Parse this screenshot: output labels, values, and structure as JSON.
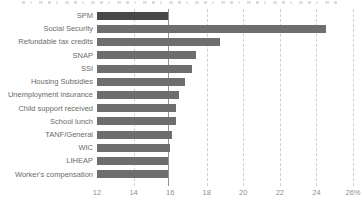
{
  "chart_data": {
    "type": "bar",
    "orientation": "horizontal",
    "title": "",
    "categories": [
      "SPM",
      "Social Security",
      "Refundable tax credits",
      "SNAP",
      "SSI",
      "Housing Subsidies",
      "Unemployment insurance",
      "Child support received",
      "School lunch",
      "TANF/General",
      "WIC",
      "LIHEAP",
      "Worker's compensation"
    ],
    "values": [
      15.9,
      24.5,
      18.7,
      17.4,
      17.2,
      16.8,
      16.5,
      16.3,
      16.3,
      16.1,
      16.0,
      15.9,
      15.9
    ],
    "unit": "%",
    "xlim": [
      12,
      26
    ],
    "x_tick_values": [
      12,
      14,
      16,
      18,
      20,
      22,
      24,
      26
    ],
    "x_tick_labels": [
      "12",
      "14",
      "16",
      "18",
      "20",
      "22",
      "24",
      "26%"
    ],
    "gridline_tick_values": [
      14,
      18,
      20,
      22,
      24,
      26
    ],
    "reference_line_x": 15.9,
    "grid": "dashed-vertical",
    "legend": "none",
    "highlight_category": "SPM",
    "colors": {
      "bar": "#6e6e6e",
      "highlight_bar": "#484848",
      "gridline": "#d0d0d0",
      "reference_line": "#808080",
      "category_label": "#6b6b6b",
      "axis_label": "#8f8f8f",
      "background": "#ffffff"
    }
  },
  "artifacts": {
    "top_edge_text": "partially visible text line cut off at the top edge (illegible)"
  }
}
